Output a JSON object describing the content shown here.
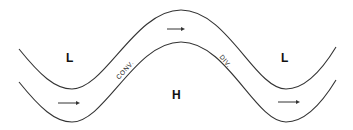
{
  "diagram": {
    "title": "",
    "colors": {
      "line": "#333333",
      "text": "#111111",
      "background": "#ffffff"
    },
    "pressure_labels": [
      {
        "id": "low-left",
        "text": "L"
      },
      {
        "id": "high-center",
        "text": "H"
      },
      {
        "id": "low-right",
        "text": "L"
      }
    ],
    "zone_labels": [
      {
        "id": "convergence",
        "text": "CONV."
      },
      {
        "id": "divergence",
        "text": "DIV."
      }
    ],
    "flow_arrows": [
      {
        "id": "arrow-left",
        "direction": "right"
      },
      {
        "id": "arrow-top",
        "direction": "right"
      },
      {
        "id": "arrow-right",
        "direction": "right"
      }
    ],
    "streamlines": [
      {
        "id": "upper-streamline"
      },
      {
        "id": "lower-streamline"
      }
    ]
  }
}
